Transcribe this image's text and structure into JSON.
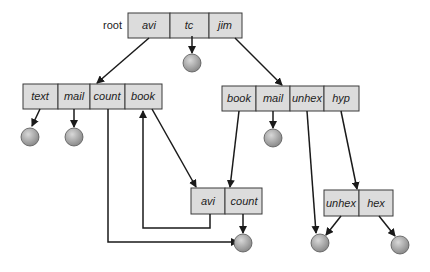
{
  "diagram": {
    "root_label": "root",
    "root_dir": [
      "avi",
      "tc",
      "jim"
    ],
    "left_dir": [
      "text",
      "mail",
      "count",
      "book"
    ],
    "right_dir": [
      "book",
      "mail",
      "unhex",
      "hyp"
    ],
    "shared_dir": [
      "avi",
      "count"
    ],
    "hyp_dir": [
      "unhex",
      "hex"
    ],
    "colors": {
      "cell_fill": "#dcdcdc",
      "node_fill": "#a0a0a0",
      "line": "#1a1a1a"
    }
  }
}
